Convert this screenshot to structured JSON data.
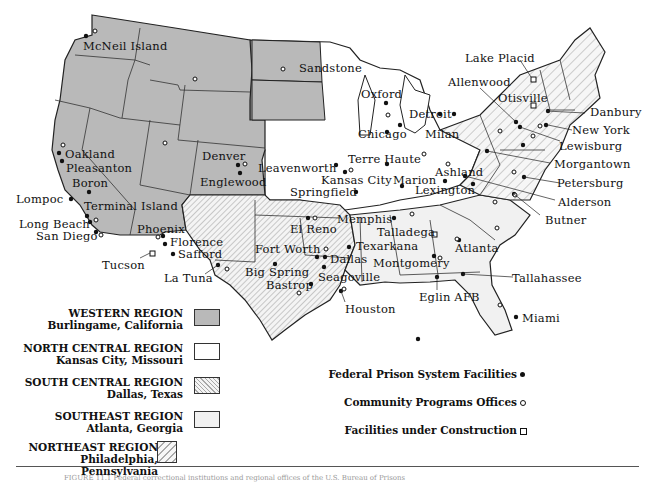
{
  "map": {
    "title": "U.S. Bureau of Prisons Regions and Facilities",
    "colors": {
      "western": "#b9b9b9",
      "north_central": "#ffffff",
      "south_central_hatch": "#cfcfcf",
      "southeast": "#f1f1f1",
      "northeast_hatch": "#c4c4c4",
      "border": "#222222"
    },
    "labels": {
      "mcneil_island": "McNeil Island",
      "sandstone": "Sandstone",
      "oxford": "Oxford",
      "lake_placid": "Lake Placid",
      "allenwood": "Allenwood",
      "otisville": "Otisville",
      "danbury": "Danbury",
      "new_york": "New York",
      "lewisburg": "Lewisburg",
      "morgantown": "Morgantown",
      "petersburg": "Petersburg",
      "alderson": "Alderson",
      "butner": "Butner",
      "detroit": "Detroit",
      "milan": "Milan",
      "chicago": "Chicago",
      "terre_haute": "Terre Haute",
      "marion": "Marion",
      "ashland": "Ashland",
      "lexington": "Lexington",
      "leavenworth": "Leavenworth",
      "kansas_city": "Kansas City",
      "springfield": "Springfield",
      "memphis": "Memphis",
      "talladega": "Talladega",
      "atlanta": "Atlanta",
      "texarkana": "Texarkana",
      "montgomery": "Montgomery",
      "tallahassee": "Tallahassee",
      "eglin_afb": "Eglin AFB",
      "miami": "Miami",
      "houston": "Houston",
      "el_reno": "El Reno",
      "fort_worth": "Fort Worth",
      "dallas": "Dallas",
      "seagoville": "Seagoville",
      "big_spring": "Big Spring",
      "bastrop": "Bastrop",
      "la_tuna": "La Tuna",
      "tucson": "Tucson",
      "safford": "Safford",
      "florence": "Florence",
      "phoenix": "Phoenix",
      "oakland": "Oakland",
      "pleasanton": "Pleasanton",
      "boron": "Boron",
      "lompoc": "Lompoc",
      "terminal_island": "Terminal Island",
      "long_beach": "Long Beach",
      "san_diego": "San Diego",
      "denver": "Denver",
      "englewood": "Englewood"
    }
  },
  "legend": {
    "regions": [
      {
        "name": "WESTERN REGION",
        "office": "Burlingame, California",
        "fill": "gray"
      },
      {
        "name": "NORTH CENTRAL REGION",
        "office": "Kansas City, Missouri",
        "fill": "white"
      },
      {
        "name": "SOUTH CENTRAL REGION",
        "office": "Dallas, Texas",
        "fill": "hatch-dense"
      },
      {
        "name": "SOUTHEAST REGION",
        "office": "Atlanta, Georgia",
        "fill": "light"
      },
      {
        "name": "NORTHEAST REGION",
        "office": "Philadelphia, Pennsylvania",
        "fill": "hatch-wide"
      }
    ],
    "symbols": [
      {
        "label": "Federal Prison System Facilities",
        "icon": "filled-circle"
      },
      {
        "label": "Community Programs Offices",
        "icon": "open-circle"
      },
      {
        "label": "Facilities under Construction",
        "icon": "open-square"
      }
    ]
  },
  "caption": "FIGURE 11.1 Federal correctional institutions and regional offices of the U.S. Bureau of Prisons"
}
